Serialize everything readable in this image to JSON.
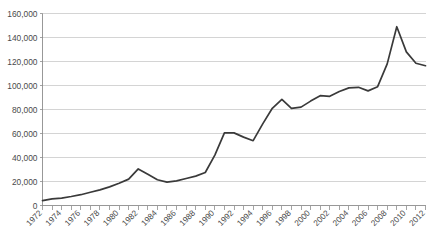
{
  "chart_data": {
    "type": "line",
    "title": "",
    "xlabel": "",
    "ylabel": "",
    "ylim": [
      0,
      160000
    ],
    "xlim": [
      1972,
      2012
    ],
    "grid": "horizontal",
    "legend": "none",
    "y_ticks": [
      "0",
      "20,000",
      "40,000",
      "60,000",
      "80,000",
      "100,000",
      "120,000",
      "140,000",
      "160,000"
    ],
    "y_tick_values": [
      0,
      20000,
      40000,
      60000,
      80000,
      100000,
      120000,
      140000,
      160000
    ],
    "x_tick_labels": [
      "1972",
      "1974",
      "1976",
      "1978",
      "1980",
      "1982",
      "1984",
      "1986",
      "1988",
      "1990",
      "1992",
      "1994",
      "1996",
      "1998",
      "2000",
      "2002",
      "2004",
      "2006",
      "2008",
      "2010",
      "2012"
    ],
    "x_tick_label_rotation": -45,
    "x_minor_tick_interval": 1,
    "series": [
      {
        "name": "series-1",
        "color": "#3a3a3a",
        "x": [
          1972,
          1973,
          1974,
          1975,
          1976,
          1977,
          1978,
          1979,
          1980,
          1981,
          1982,
          1983,
          1984,
          1985,
          1986,
          1987,
          1988,
          1989,
          1990,
          1991,
          1992,
          1993,
          1994,
          1995,
          1996,
          1997,
          1998,
          1999,
          2000,
          2001,
          2002,
          2003,
          2004,
          2005,
          2006,
          2007,
          2008,
          2009,
          2010,
          2011,
          2012
        ],
        "values": [
          4000,
          5500,
          6200,
          7500,
          9000,
          11000,
          13000,
          15500,
          18500,
          22000,
          30500,
          26000,
          21500,
          19500,
          20500,
          22500,
          24500,
          27500,
          42000,
          60500,
          60500,
          57000,
          54000,
          68000,
          81000,
          88500,
          81000,
          82000,
          87000,
          91500,
          91000,
          95000,
          98000,
          98500,
          95500,
          99000,
          118000,
          149000,
          128000,
          118500,
          116500
        ]
      }
    ]
  },
  "axis": {
    "y_axis_name": "y-axis",
    "x_axis_name": "x-axis"
  },
  "colors": {
    "line": "#3a3a3a",
    "gridline": "#c9c9c9",
    "axis": "#8d8d8d",
    "text": "#4a4a4a",
    "background": "#ffffff"
  }
}
